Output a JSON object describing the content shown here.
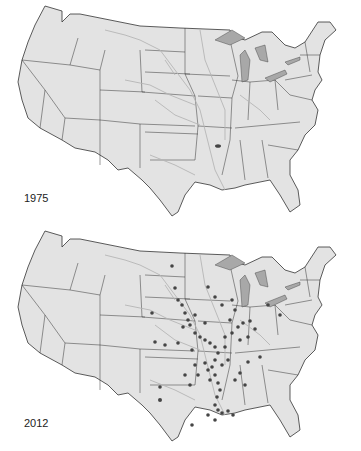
{
  "panels": [
    {
      "year": "1975"
    },
    {
      "year": "2012"
    }
  ],
  "colors": {
    "land": "#e3e3e3",
    "border": "#333333",
    "river": "#b5b5b5",
    "lake": "#a8a8a8",
    "dot": "#454545"
  }
}
